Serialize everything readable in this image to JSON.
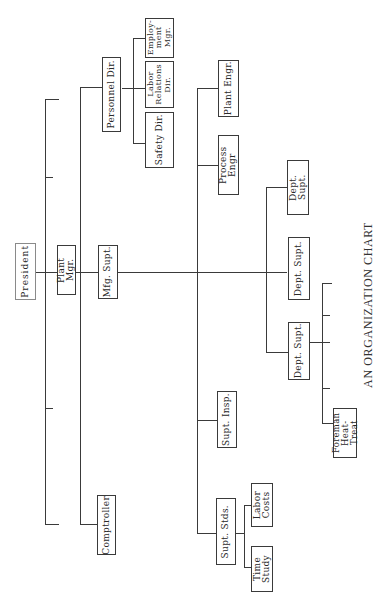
{
  "title": "AN ORGANIZATION CHART",
  "nodes": {
    "president": "President",
    "plant_mgr": "Plant Mgr.",
    "mfg_supt": "Mfg. Supt.",
    "comptroller": "Comptroller",
    "personnel_dir": "Personnel Dir.",
    "safety_dir": "Safety Dir.",
    "labor_relations_dir": "Labor\nRelations\nDir.",
    "employment_mgr": "Employ-\nment\nMgr.",
    "plant_engr": "Plant Engr.",
    "process_engr": "Process Engr",
    "supt_insp": "Supt. Insp.",
    "supt_stds": "Supt. Stds.",
    "labor_costs": "Labor\nCosts",
    "time_study": "Time\nStudy",
    "dept_supt_1": "Dept. Supt.",
    "dept_supt_2": "Dept. Supt.",
    "dept_supt_3": "Dept. Supt.",
    "foreman_heat_treat": "Foreman\nHeat-Treat"
  },
  "hierarchy": {
    "President": {
      "Plant Mgr.": {
        "Personnel Dir.": [
          "Safety Dir.",
          "Labor Relations Dir.",
          "Employment Mgr."
        ],
        "Comptroller": [],
        "Mfg. Supt.": {
          "Plant Engr.": [],
          "Process Engr": [],
          "Supt. Insp.": [],
          "Supt. Stds.": [
            "Labor Costs",
            "Time Study"
          ],
          "Dept. Supt. (1)": [],
          "Dept. Supt. (2)": [],
          "Dept. Supt. (3)": [
            "Foreman Heat-Treat"
          ]
        }
      }
    }
  }
}
